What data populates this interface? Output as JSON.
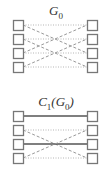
{
  "graphs": [
    {
      "title": "G",
      "title_sub": "0",
      "title_y": 3,
      "node_tops": [
        20,
        34,
        48,
        62
      ],
      "edges": [
        {
          "from": 0,
          "to": 0,
          "style": "dotted"
        },
        {
          "from": 0,
          "to": 2,
          "style": "dashed"
        },
        {
          "from": 1,
          "to": 1,
          "style": "dotted"
        },
        {
          "from": 1,
          "to": 3,
          "style": "dashed"
        },
        {
          "from": 2,
          "to": 0,
          "style": "dashed"
        },
        {
          "from": 2,
          "to": 2,
          "style": "dotted"
        },
        {
          "from": 3,
          "to": 1,
          "style": "dashed"
        },
        {
          "from": 3,
          "to": 3,
          "style": "dotted"
        }
      ]
    },
    {
      "title": "C",
      "title_sub": "1",
      "title_paren": "(G",
      "title_paren_sub": "0",
      "title_close": ")",
      "title_y": 94,
      "node_tops": [
        111,
        125,
        139,
        153
      ],
      "edges": [
        {
          "from": 0,
          "to": 0,
          "style": "solid"
        },
        {
          "from": 1,
          "to": 1,
          "style": "dotted"
        },
        {
          "from": 1,
          "to": 3,
          "style": "dashed"
        },
        {
          "from": 2,
          "to": 2,
          "style": "solid"
        },
        {
          "from": 3,
          "to": 1,
          "style": "dashed"
        },
        {
          "from": 3,
          "to": 3,
          "style": "dotted"
        }
      ]
    }
  ],
  "colors": {
    "node_border": "#777777",
    "edge": "#999999",
    "solid_edge": "#555555"
  }
}
